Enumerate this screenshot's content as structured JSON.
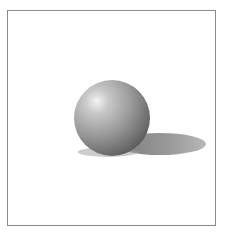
{
  "scene": {
    "subject": "shaded sphere with cast shadow",
    "colors": {
      "background": "#ffffff",
      "frame_border": "#8a8a8a",
      "sphere_highlight": "#f2f2f2",
      "sphere_mid": "#9a9a9a",
      "sphere_dark": "#4a4a4a",
      "shadow": "#8c8c8c"
    }
  }
}
